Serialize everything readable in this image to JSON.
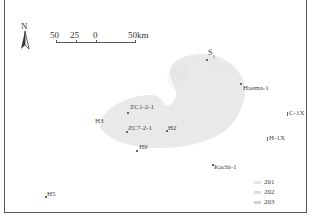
{
  "map": {
    "north_arrow": {
      "label": "N",
      "icon": "north-arrow-icon"
    },
    "scale_bar": {
      "labels": [
        "50",
        "25",
        "0",
        "50km"
      ],
      "units": "km"
    },
    "region_fill_color": "#e8e8e8",
    "region_hatch_color": "#d6d6d6",
    "wells": [
      {
        "name": "S1",
        "display": "S",
        "subscript": "1"
      },
      {
        "name": "Haema-1",
        "display": "Haema-1"
      },
      {
        "name": "C-1X",
        "display": "C-1X"
      },
      {
        "name": "H-1X",
        "display": "H-1X"
      },
      {
        "name": "ZC1-2-1",
        "display": "ZC1-2-1"
      },
      {
        "name": "H3",
        "display": "H3"
      },
      {
        "name": "ZC7-2-1",
        "display": "ZC7-2-1"
      },
      {
        "name": "H2",
        "display": "H2"
      },
      {
        "name": "H9",
        "display": "H9"
      },
      {
        "name": "Kachi-1",
        "display": "Kachi-1"
      },
      {
        "name": "H5",
        "display": "H5"
      }
    ],
    "legend": {
      "items": [
        {
          "label": "201",
          "color": "#e6e6e6"
        },
        {
          "label": "202",
          "color": "#dcdcdc"
        },
        {
          "label": "203",
          "color": "#d2d2d2"
        }
      ]
    }
  }
}
